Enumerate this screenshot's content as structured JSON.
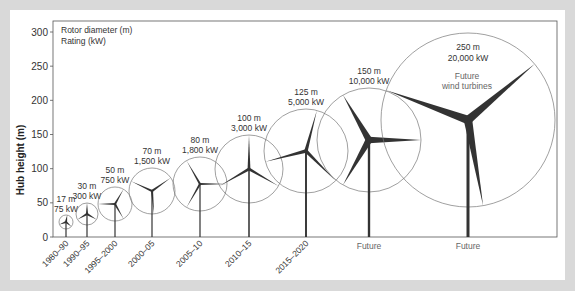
{
  "chart_data": {
    "type": "scatter",
    "title": "",
    "legend_note": [
      "Rotor diameter (m)",
      "Rating (kW)"
    ],
    "xlabel": "",
    "ylabel": "Hub height (m)",
    "ylim": [
      0,
      300
    ],
    "yticks": [
      0,
      50,
      100,
      150,
      200,
      250,
      300
    ],
    "grid": false,
    "categories": [
      "1980–90",
      "1990–95",
      "1995–2000",
      "2000–05",
      "2005–10",
      "2010–15",
      "2015–2020",
      "Future",
      "Future"
    ],
    "series": [
      {
        "name": "Hub height (m)",
        "values": [
          22,
          34,
          49,
          67,
          78,
          100,
          125,
          141,
          170
        ]
      },
      {
        "name": "Rotor diameter (m)",
        "values": [
          17,
          30,
          50,
          70,
          80,
          100,
          125,
          150,
          250
        ]
      },
      {
        "name": "Rating (kW)",
        "values": [
          75,
          300,
          750,
          1500,
          1800,
          3000,
          5000,
          10000,
          20000
        ]
      }
    ],
    "annotations": [
      {
        "text": "Future wind turbines",
        "target": "250 m / 20,000 kW turbine"
      }
    ]
  },
  "figure": {
    "legend_line1": "Rotor diameter (m)",
    "legend_line2": "Rating (kW)",
    "ylabel": "Hub height (m)",
    "future_note_line1": "Future",
    "future_note_line2": "wind turbines",
    "colors": {
      "tower": "#333333",
      "circle": "#777777",
      "text": "#333333",
      "future_text": "#666666",
      "frame": "#555555"
    },
    "turbines": [
      {
        "period": "1980–90",
        "diameter_label": "17 m",
        "rating_label": "75 kW",
        "x": 66,
        "hub": 222,
        "r": 7,
        "rot": 10,
        "future": false
      },
      {
        "period": "1990–95",
        "diameter_label": "30 m",
        "rating_label": "300 kW",
        "x": 87,
        "hub": 214,
        "r": 11,
        "rot": 0,
        "future": false
      },
      {
        "period": "1995–2000",
        "diameter_label": "50 m",
        "rating_label": "750 kW",
        "x": 115,
        "hub": 204,
        "r": 17,
        "rot": 30,
        "future": false
      },
      {
        "period": "2000–05",
        "diameter_label": "70 m",
        "rating_label": "1,500 kW",
        "x": 152,
        "hub": 191,
        "r": 23,
        "rot": 55,
        "future": false
      },
      {
        "period": "2005–10",
        "diameter_label": "80 m",
        "rating_label": "1,800 kW",
        "x": 200,
        "hub": 184,
        "r": 27,
        "rot": 90,
        "future": false
      },
      {
        "period": "2010–15",
        "diameter_label": "100 m",
        "rating_label": "3,000 kW",
        "x": 249,
        "hub": 169,
        "r": 34,
        "rot": 0,
        "future": false
      },
      {
        "period": "2015–2020",
        "diameter_label": "125 m",
        "rating_label": "5,000 kW",
        "x": 306,
        "hub": 151,
        "r": 42,
        "rot": 15,
        "future": false
      },
      {
        "period": "Future",
        "diameter_label": "150 m",
        "rating_label": "10,000 kW",
        "x": 369,
        "hub": 140,
        "r": 52,
        "rot": 90,
        "future": true
      },
      {
        "period": "Future",
        "diameter_label": "250 m",
        "rating_label": "20,000 kW",
        "x": 468,
        "hub": 120,
        "r": 87,
        "rot": 50,
        "future": true
      }
    ]
  }
}
